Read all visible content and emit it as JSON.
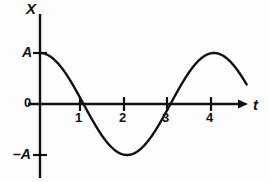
{
  "figure": {
    "title": "",
    "background_color": "#fdfdfd",
    "ink_color": "#111111"
  },
  "axes": {
    "y_axis_label": "X",
    "x_axis_label": "t",
    "origin_label": "0",
    "amplitude_positive_label": "A",
    "amplitude_negative_label": "–A",
    "x_tick_labels": [
      "1",
      "2",
      "3",
      "4"
    ]
  },
  "chart_data": {
    "type": "line",
    "title": "",
    "xlabel": "t",
    "ylabel": "X",
    "grid": false,
    "legend": null,
    "xlim": [
      0,
      4.75
    ],
    "ylim": [
      -1.15,
      1.35
    ],
    "xticks": [
      1,
      2,
      3,
      4
    ],
    "xticklabels": [
      "1",
      "2",
      "3",
      "4"
    ],
    "yticks": [
      -1,
      0,
      1
    ],
    "yticklabels": [
      "–A",
      "0",
      "A"
    ],
    "series": [
      {
        "name": "X(t) = A cos(2πt/4)",
        "equation": "X = A*cos(pi*t/2)",
        "amplitude": 1,
        "period": 4,
        "phase": 0,
        "x": [
          0,
          0.25,
          0.5,
          0.75,
          1,
          1.25,
          1.5,
          1.75,
          2,
          2.25,
          2.5,
          2.75,
          3,
          3.25,
          3.5,
          3.75,
          4,
          4.25,
          4.5,
          4.75
        ],
        "y": [
          1,
          0.924,
          0.707,
          0.383,
          0,
          -0.383,
          -0.707,
          -0.924,
          -1,
          -0.924,
          -0.707,
          -0.383,
          0,
          0.383,
          0.707,
          0.924,
          1,
          0.924,
          0.707,
          0.383
        ]
      }
    ],
    "annotations": [
      {
        "label": "A",
        "value": 1,
        "axis": "y"
      },
      {
        "label": "0",
        "value": 0,
        "axis": "y"
      },
      {
        "label": "–A",
        "value": -1,
        "axis": "y"
      }
    ]
  }
}
